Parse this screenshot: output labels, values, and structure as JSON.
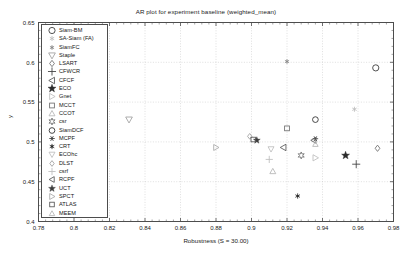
{
  "chart_data": {
    "type": "scatter",
    "title": "AR plot for experiment baseline (weighted_mean)",
    "xlabel": "Robustness (S = 30.00)",
    "ylabel": "y",
    "xlim": [
      0.78,
      0.98
    ],
    "ylim": [
      0.4,
      0.65
    ],
    "xticks": [
      "0.78",
      "0.8",
      "0.82",
      "0.84",
      "0.86",
      "0.88",
      "0.9",
      "0.92",
      "0.94",
      "0.96",
      "0.98"
    ],
    "xtick_values": [
      0.78,
      0.8,
      0.82,
      0.84,
      0.86,
      0.88,
      0.9,
      0.92,
      0.94,
      0.96,
      0.98
    ],
    "yticks": [
      "0.65",
      "0.6",
      "0.55",
      "0.5",
      "0.45",
      "0.4"
    ],
    "ytick_values": [
      0.65,
      0.6,
      0.55,
      0.5,
      0.45,
      0.4
    ],
    "grid": true,
    "legend_position": "upper left",
    "series": [
      {
        "name": "Siam-BM",
        "marker": "circle",
        "color": "#333333",
        "size": 5.0,
        "x": 0.97,
        "y": 0.593
      },
      {
        "name": "SA-Siam (FA)",
        "marker": "asterisk",
        "color": "#bdbdbd",
        "size": 4.2,
        "x": 0.958,
        "y": 0.541
      },
      {
        "name": "SiamFC",
        "marker": "asterisk-dot",
        "color": "#8c8c8c",
        "size": 4.0,
        "x": 0.92,
        "y": 0.601
      },
      {
        "name": "Staple",
        "marker": "triangle-down",
        "color": "#9e9e9e",
        "size": 5.4,
        "x": 0.831,
        "y": 0.528
      },
      {
        "name": "LSART",
        "marker": "diamond",
        "color": "#6e6e6e",
        "size": 4.6,
        "x": 0.971,
        "y": 0.492
      },
      {
        "name": "CFWCR",
        "marker": "plus",
        "color": "#3d3d3d",
        "size": 5.6,
        "x": 0.959,
        "y": 0.472
      },
      {
        "name": "CFCF",
        "marker": "triangle-left",
        "color": "#555555",
        "size": 5.2,
        "x": 0.918,
        "y": 0.493
      },
      {
        "name": "ECO",
        "marker": "star5",
        "color": "#2b2b2b",
        "size": 5.4,
        "x": 0.953,
        "y": 0.483
      },
      {
        "name": "Gnet",
        "marker": "triangle-right",
        "color": "#bdbdbd",
        "size": 5.0,
        "x": 0.936,
        "y": 0.48
      },
      {
        "name": "MCCT",
        "marker": "square",
        "color": "#6e6e6e",
        "size": 4.6,
        "x": 0.92,
        "y": 0.517
      },
      {
        "name": "CCOT",
        "marker": "triangle-up",
        "color": "#b5b5b5",
        "size": 4.8,
        "x": 0.912,
        "y": 0.463
      },
      {
        "name": "csr",
        "marker": "star6",
        "color": "#707070",
        "size": 4.8,
        "x": 0.928,
        "y": 0.483
      },
      {
        "name": "SiamDCF",
        "marker": "circle",
        "color": "#2b2b2b",
        "size": 4.6,
        "x": 0.936,
        "y": 0.528
      },
      {
        "name": "MCPF",
        "marker": "xstar",
        "color": "#3d3d3d",
        "size": 4.6,
        "x": 0.936,
        "y": 0.504
      },
      {
        "name": "CRT",
        "marker": "asterisk-dot",
        "color": "#2b2b2b",
        "size": 4.4,
        "x": 0.926,
        "y": 0.432
      },
      {
        "name": "ECOhc",
        "marker": "triangle-down",
        "color": "#bdbdbd",
        "size": 4.8,
        "x": 0.911,
        "y": 0.491
      },
      {
        "name": "DLST",
        "marker": "diamond",
        "color": "#9e9e9e",
        "size": 4.2,
        "x": 0.899,
        "y": 0.507
      },
      {
        "name": "csrf",
        "marker": "plus",
        "color": "#bdbdbd",
        "size": 5.0,
        "x": 0.91,
        "y": 0.478
      },
      {
        "name": "RCPF",
        "marker": "triangle-left",
        "color": "#555555",
        "size": 4.6,
        "x": 0.935,
        "y": 0.502
      },
      {
        "name": "UCT",
        "marker": "star5",
        "color": "#3d3d3d",
        "size": 4.6,
        "x": 0.903,
        "y": 0.502
      },
      {
        "name": "SPCT",
        "marker": "triangle-right",
        "color": "#a8a8a8",
        "size": 4.8,
        "x": 0.88,
        "y": 0.493
      },
      {
        "name": "ATLAS",
        "marker": "square",
        "color": "#555555",
        "size": 4.4,
        "x": 0.901,
        "y": 0.503
      },
      {
        "name": "MEEM",
        "marker": "triangle-up",
        "color": "#b5b5b5",
        "size": 4.4,
        "x": 0.936,
        "y": 0.497
      }
    ]
  }
}
